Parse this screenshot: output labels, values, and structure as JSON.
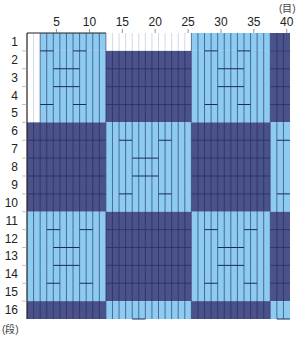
{
  "chart_data": {
    "type": "heatmap",
    "title": "",
    "xlabel": "(目)",
    "ylabel": "(段)",
    "columns": 40,
    "rows": 16,
    "x_tick_labels": [
      "5",
      "10",
      "15",
      "20",
      "25",
      "30",
      "35",
      "40"
    ],
    "x_tick_positions": [
      5,
      10,
      15,
      20,
      25,
      30,
      35,
      40
    ],
    "y_tick_labels": [
      "1",
      "2",
      "3",
      "4",
      "5",
      "6",
      "7",
      "8",
      "9",
      "10",
      "11",
      "12",
      "13",
      "14",
      "15",
      "16"
    ],
    "legend": [
      {
        "key": "W",
        "name": "white",
        "color": "#ffffff"
      },
      {
        "key": "L",
        "name": "light blue",
        "color": "#8dcbf1"
      },
      {
        "key": "D",
        "name": "navy",
        "color": "#4b5189"
      }
    ],
    "blocks": [
      {
        "rows": [
          1,
          1
        ],
        "cols": [
          1,
          2
        ],
        "color": "W"
      },
      {
        "rows": [
          1,
          1
        ],
        "cols": [
          3,
          12
        ],
        "color": "L"
      },
      {
        "rows": [
          1,
          1
        ],
        "cols": [
          13,
          25
        ],
        "color": "W"
      },
      {
        "rows": [
          1,
          1
        ],
        "cols": [
          26,
          37
        ],
        "color": "L"
      },
      {
        "rows": [
          1,
          1
        ],
        "cols": [
          38,
          40
        ],
        "color": "D"
      },
      {
        "rows": [
          2,
          5
        ],
        "cols": [
          1,
          2
        ],
        "color": "W"
      },
      {
        "rows": [
          2,
          5
        ],
        "cols": [
          3,
          12
        ],
        "color": "L"
      },
      {
        "rows": [
          2,
          5
        ],
        "cols": [
          13,
          25
        ],
        "color": "D"
      },
      {
        "rows": [
          2,
          5
        ],
        "cols": [
          26,
          37
        ],
        "color": "L"
      },
      {
        "rows": [
          2,
          5
        ],
        "cols": [
          38,
          40
        ],
        "color": "D"
      },
      {
        "rows": [
          6,
          10
        ],
        "cols": [
          1,
          12
        ],
        "color": "D"
      },
      {
        "rows": [
          6,
          10
        ],
        "cols": [
          13,
          25
        ],
        "color": "L"
      },
      {
        "rows": [
          6,
          10
        ],
        "cols": [
          26,
          37
        ],
        "color": "D"
      },
      {
        "rows": [
          6,
          10
        ],
        "cols": [
          38,
          40
        ],
        "color": "L"
      },
      {
        "rows": [
          11,
          15
        ],
        "cols": [
          1,
          12
        ],
        "color": "L"
      },
      {
        "rows": [
          11,
          15
        ],
        "cols": [
          13,
          25
        ],
        "color": "D"
      },
      {
        "rows": [
          11,
          15
        ],
        "cols": [
          26,
          37
        ],
        "color": "L"
      },
      {
        "rows": [
          11,
          15
        ],
        "cols": [
          38,
          40
        ],
        "color": "D"
      },
      {
        "rows": [
          16,
          16
        ],
        "cols": [
          1,
          12
        ],
        "color": "D"
      },
      {
        "rows": [
          16,
          16
        ],
        "cols": [
          13,
          25
        ],
        "color": "L"
      },
      {
        "rows": [
          16,
          16
        ],
        "cols": [
          26,
          37
        ],
        "color": "D"
      },
      {
        "rows": [
          16,
          16
        ],
        "cols": [
          38,
          40
        ],
        "color": "L"
      }
    ],
    "marks": [
      {
        "row_boundary": 1,
        "cols": [
          3,
          4
        ]
      },
      {
        "row_boundary": 1,
        "cols": [
          8,
          9
        ]
      },
      {
        "row_boundary": 2,
        "cols": [
          5,
          8
        ]
      },
      {
        "row_boundary": 3,
        "cols": [
          5,
          8
        ]
      },
      {
        "row_boundary": 4,
        "cols": [
          3,
          4
        ]
      },
      {
        "row_boundary": 4,
        "cols": [
          8,
          9
        ]
      },
      {
        "row_boundary": 1,
        "cols": [
          28,
          29
        ]
      },
      {
        "row_boundary": 1,
        "cols": [
          33,
          34
        ]
      },
      {
        "row_boundary": 2,
        "cols": [
          30,
          33
        ]
      },
      {
        "row_boundary": 3,
        "cols": [
          30,
          33
        ]
      },
      {
        "row_boundary": 4,
        "cols": [
          28,
          29
        ]
      },
      {
        "row_boundary": 4,
        "cols": [
          33,
          34
        ]
      },
      {
        "row_boundary": 6,
        "cols": [
          15,
          16
        ]
      },
      {
        "row_boundary": 6,
        "cols": [
          21,
          22
        ]
      },
      {
        "row_boundary": 7,
        "cols": [
          17,
          20
        ]
      },
      {
        "row_boundary": 8,
        "cols": [
          17,
          20
        ]
      },
      {
        "row_boundary": 9,
        "cols": [
          15,
          16
        ]
      },
      {
        "row_boundary": 9,
        "cols": [
          21,
          22
        ]
      },
      {
        "row_boundary": 6,
        "cols": [
          39,
          40
        ]
      },
      {
        "row_boundary": 9,
        "cols": [
          39,
          40
        ]
      },
      {
        "row_boundary": 11,
        "cols": [
          4,
          5
        ]
      },
      {
        "row_boundary": 11,
        "cols": [
          9,
          10
        ]
      },
      {
        "row_boundary": 12,
        "cols": [
          5,
          8
        ]
      },
      {
        "row_boundary": 13,
        "cols": [
          5,
          8
        ]
      },
      {
        "row_boundary": 14,
        "cols": [
          4,
          5
        ]
      },
      {
        "row_boundary": 14,
        "cols": [
          9,
          10
        ]
      },
      {
        "row_boundary": 11,
        "cols": [
          28,
          29
        ]
      },
      {
        "row_boundary": 11,
        "cols": [
          34,
          35
        ]
      },
      {
        "row_boundary": 12,
        "cols": [
          30,
          33
        ]
      },
      {
        "row_boundary": 13,
        "cols": [
          30,
          33
        ]
      },
      {
        "row_boundary": 14,
        "cols": [
          28,
          29
        ]
      },
      {
        "row_boundary": 14,
        "cols": [
          34,
          35
        ]
      },
      {
        "row_boundary": 16,
        "cols": [
          17,
          18
        ]
      },
      {
        "row_boundary": 16,
        "cols": [
          39,
          40
        ]
      }
    ],
    "grid": true
  },
  "labels": {
    "x_unit": "(目)",
    "y_unit": "(段)"
  },
  "colors": {
    "white": "#ffffff",
    "light": "#8dcbf1",
    "dark": "#4b5189",
    "line_dark": "#1d2a5c",
    "line_light": "#c9cfe0",
    "border": "#222222"
  }
}
